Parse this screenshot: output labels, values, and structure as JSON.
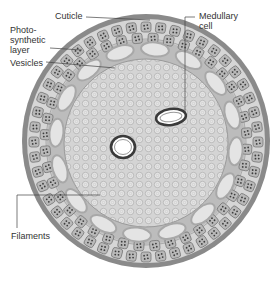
{
  "figure": {
    "labels": [
      {
        "id": "cuticle",
        "text": "Cuticle"
      },
      {
        "id": "photosynthetic-layer",
        "text": "Photo-\nsynthetic\nlayer"
      },
      {
        "id": "vesicles",
        "text": "Vesicles"
      },
      {
        "id": "medullary-cell",
        "text": "Medullary\ncell"
      },
      {
        "id": "filaments",
        "text": "Filaments"
      }
    ]
  },
  "colors": {
    "cuticle": "#8a8a8a",
    "outer_layer": "#d6d6d6",
    "cell_fill": "#b9b9b9",
    "cell_stroke": "#6e6e6e",
    "vesicle_ring": "#a8a8a8",
    "vesicle_fill": "#e4e4e4",
    "core": "#d2d2d2",
    "filament": "#bdbdbd",
    "medullary": "#404040",
    "label_text": "#333333",
    "leader": "#444444"
  }
}
